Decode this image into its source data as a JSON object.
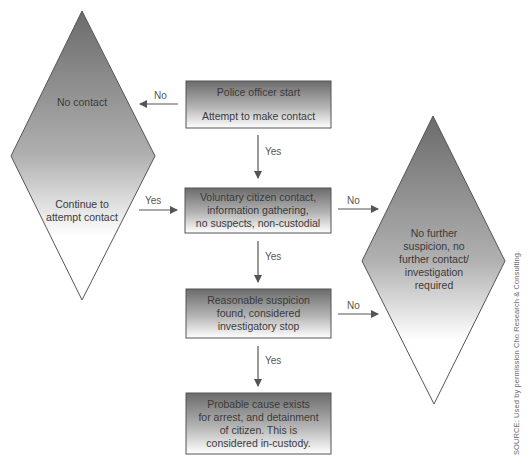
{
  "diagram": {
    "type": "flowchart",
    "colors": {
      "shape_dark": "#6b6b6b",
      "shape_light": "#ffffff",
      "stroke": "#555555",
      "arrow": "#555555",
      "text": "#3a3a3a"
    },
    "nodes": {
      "start": {
        "title": "Police officer start",
        "subtitle": "Attempt to make contact"
      },
      "voluntary_contact": {
        "line1": "Voluntary citizen contact,",
        "line2": "information gathering,",
        "line3": "no suspects, non-custodial"
      },
      "reasonable_suspicion": {
        "line1": "Reasonable suspicion",
        "line2": "found, considered",
        "line3": "investigatory stop"
      },
      "probable_cause": {
        "line1": "Probable cause exists",
        "line2": "for arrest, and detainment",
        "line3": "of citizen. This is",
        "line4": "considered in-custody."
      },
      "left_diamond": {
        "top_label": "No contact",
        "bottom_line1": "Continue to",
        "bottom_line2": "attempt contact"
      },
      "right_diamond": {
        "line1": "No further",
        "line2": "suspicion, no",
        "line3": "further contact/",
        "line4": "investigation",
        "line5": "required"
      }
    },
    "edges": {
      "start_to_left_diamond": "No",
      "start_to_voluntary": "Yes",
      "left_diamond_to_voluntary": "Yes",
      "voluntary_to_right_diamond": "No",
      "voluntary_to_suspicion": "Yes",
      "suspicion_to_right_diamond": "No",
      "suspicion_to_probable_cause": "Yes"
    },
    "source": "SOURCE: Used by permission Cho Research & Consulting."
  }
}
